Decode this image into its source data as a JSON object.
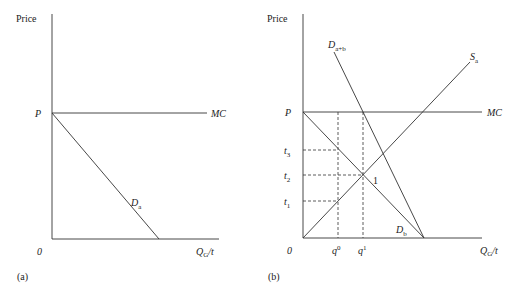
{
  "panel_a": {
    "caption": "(a)",
    "y_axis_label": "Price",
    "x_axis_label_main": "Q",
    "x_axis_label_sub": "G",
    "x_axis_label_tail": "/t",
    "origin_label": "0",
    "price_label": "P",
    "mc_label": "MC",
    "demand_label_main": "D",
    "demand_label_sub": "a"
  },
  "panel_b": {
    "caption": "(b)",
    "y_axis_label": "Price",
    "x_axis_label_main": "Q",
    "x_axis_label_sub": "G",
    "x_axis_label_tail": "/t",
    "origin_label": "0",
    "price_label": "P",
    "mc_label": "MC",
    "t3_main": "t",
    "t3_sub": "3",
    "t2_main": "t",
    "t2_sub": "2",
    "t1_main": "t",
    "t1_sub": "1",
    "q0_main": "q",
    "q0_sup": "0",
    "q1_main": "q",
    "q1_sup": "1",
    "dab_main": "D",
    "dab_sub": "a+b",
    "sa_main": "S",
    "sa_sub": "a",
    "db_main": "D",
    "db_sub": "b",
    "point_label": "1"
  },
  "colors": {
    "line": "#333333",
    "text": "#222222",
    "background": "#ffffff"
  }
}
